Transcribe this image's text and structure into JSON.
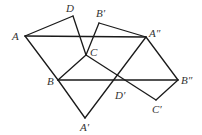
{
  "diagram": {
    "title": "",
    "points": {
      "A": {
        "label": "A",
        "x": 25,
        "y": 36,
        "lx": 12,
        "ly": 40
      },
      "D": {
        "label": "D",
        "x": 73,
        "y": 16,
        "lx": 66,
        "ly": 12
      },
      "B'": {
        "label": "B′",
        "x": 99,
        "y": 23,
        "lx": 96,
        "ly": 17
      },
      "C": {
        "label": "C",
        "x": 86,
        "y": 55,
        "lx": 90,
        "ly": 56
      },
      "A''": {
        "label": "A″",
        "x": 146,
        "y": 37,
        "lx": 149,
        "ly": 37
      },
      "B": {
        "label": "B",
        "x": 58,
        "y": 80,
        "lx": 47,
        "ly": 85
      },
      "B''": {
        "label": "B″",
        "x": 178,
        "y": 80,
        "lx": 181,
        "ly": 84
      },
      "D'": {
        "label": "D′",
        "x": 120,
        "y": 89,
        "lx": 115,
        "ly": 99
      },
      "C'": {
        "label": "C′",
        "x": 156,
        "y": 100,
        "lx": 152,
        "ly": 113
      },
      "A'": {
        "label": "A′",
        "x": 85,
        "y": 118,
        "lx": 80,
        "ly": 131
      }
    },
    "segments": [
      [
        "A",
        "D"
      ],
      [
        "D",
        "C"
      ],
      [
        "A",
        "B"
      ],
      [
        "B",
        "C"
      ],
      [
        "A",
        "A''"
      ],
      [
        "B'",
        "C"
      ],
      [
        "B'",
        "A''"
      ],
      [
        "B",
        "B''"
      ],
      [
        "B",
        "A'"
      ],
      [
        "A'",
        "A''"
      ],
      [
        "C",
        "C'"
      ],
      [
        "C'",
        "B''"
      ],
      [
        "B''",
        "A''"
      ]
    ],
    "line_color": "#1a1a1a",
    "label_color": "#333333"
  }
}
